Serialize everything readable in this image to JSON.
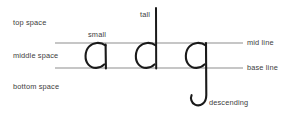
{
  "diagram": {
    "background_color": "#ffffff",
    "guide_line_color": "#8d8d8d",
    "letter_stroke_color": "#1a1a1a",
    "text_color": "#3c3c3c",
    "labels": {
      "top_space": "top space",
      "middle_space": "middle space",
      "bottom_space": "bottom space",
      "small": "small",
      "tall": "tall",
      "mid_line": "mid line",
      "base_line": "base line",
      "descending": "descending"
    },
    "letters": [
      {
        "glyph": "a",
        "note": "small"
      },
      {
        "glyph": "d",
        "note": "tall"
      },
      {
        "glyph": "g",
        "note": "descending"
      }
    ]
  }
}
